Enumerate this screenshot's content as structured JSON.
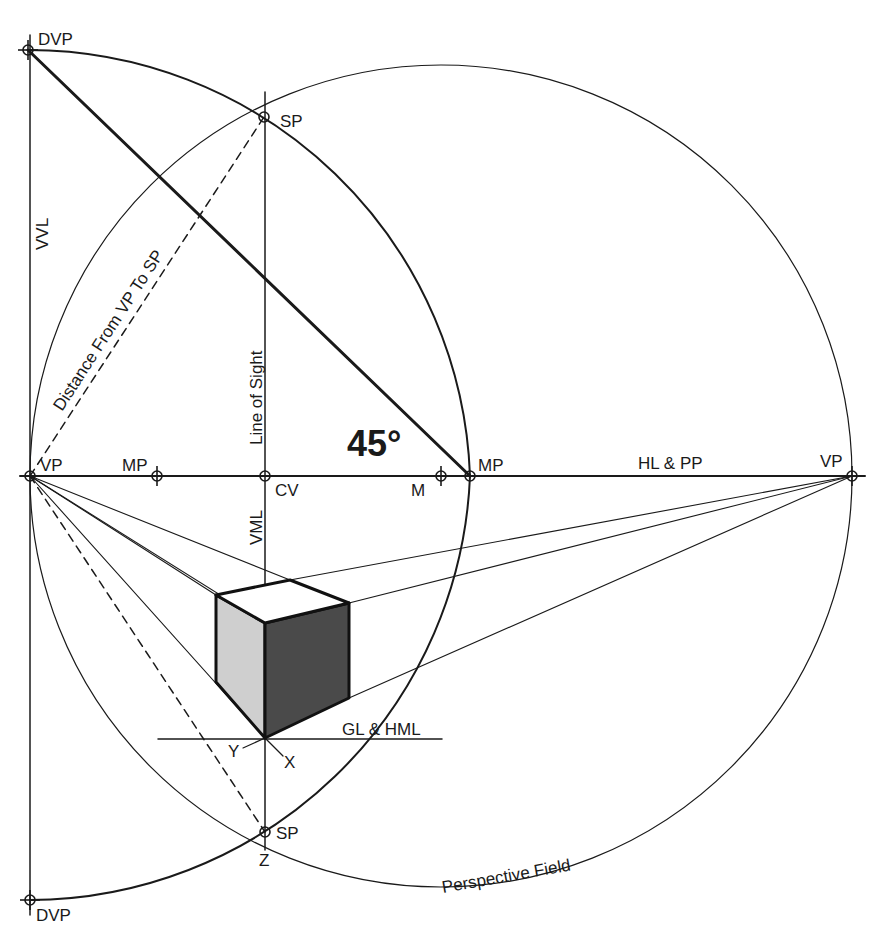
{
  "colors": {
    "background": "#ffffff",
    "line": "#1a1a1a",
    "cube_left_face": "#cfcfcf",
    "cube_right_face": "#4a4a4a",
    "cube_top_face": "#ffffff"
  },
  "labels": {
    "dvp_top": "DVP",
    "dvp_bottom": "DVP",
    "sp_top": "SP",
    "sp_bottom": "SP",
    "vp_left": "VP",
    "vp_right": "VP",
    "mp_left": "MP",
    "mp_right": "MP",
    "m": "M",
    "cv": "CV",
    "z": "Z",
    "x": "X",
    "y": "Y",
    "vvl": "VVL",
    "vml": "VML",
    "line_of_sight": "Line of Sight",
    "distance": "Distance From VP To SP",
    "hl_pp": "HL & PP",
    "gl_hml": "GL & HML",
    "perspective_field": "Perspective Field",
    "angle": "45°"
  },
  "points": {
    "vp_left": [
      30,
      476
    ],
    "vp_right": [
      852,
      476
    ],
    "cv": [
      265,
      476
    ],
    "mp_left": [
      157,
      476
    ],
    "mp_right": [
      470,
      476
    ],
    "m": [
      441,
      476
    ],
    "sp_top": [
      264,
      117
    ],
    "sp_bottom": [
      265,
      832
    ],
    "dvp_top": [
      28,
      50
    ],
    "dvp_bottom": [
      30,
      900
    ]
  }
}
